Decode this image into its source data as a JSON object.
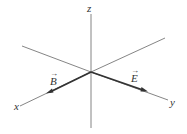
{
  "diagram": {
    "origin": {
      "x": 91,
      "y": 72
    },
    "axes": [
      {
        "name": "z",
        "label": "z",
        "from": {
          "x": 91,
          "y": 14
        },
        "to": {
          "x": 91,
          "y": 128
        }
      },
      {
        "name": "x",
        "label": "x",
        "from": {
          "x": 91,
          "y": 72
        },
        "to": {
          "x": 20,
          "y": 106
        }
      },
      {
        "name": "x-back",
        "label": "",
        "from": {
          "x": 91,
          "y": 72
        },
        "to": {
          "x": 22,
          "y": 46
        }
      },
      {
        "name": "y",
        "label": "y",
        "from": {
          "x": 91,
          "y": 72
        },
        "to": {
          "x": 168,
          "y": 100
        }
      },
      {
        "name": "y-back",
        "label": "",
        "from": {
          "x": 91,
          "y": 72
        },
        "to": {
          "x": 165,
          "y": 38
        }
      }
    ],
    "vectors": [
      {
        "name": "B",
        "label": "B",
        "from": {
          "x": 91,
          "y": 72
        },
        "to": {
          "x": 49,
          "y": 92
        }
      },
      {
        "name": "E",
        "label": "E",
        "from": {
          "x": 91,
          "y": 72
        },
        "to": {
          "x": 145,
          "y": 91
        }
      }
    ],
    "colors": {
      "axis": "#777777",
      "vector": "#333333",
      "text": "#333333"
    }
  }
}
